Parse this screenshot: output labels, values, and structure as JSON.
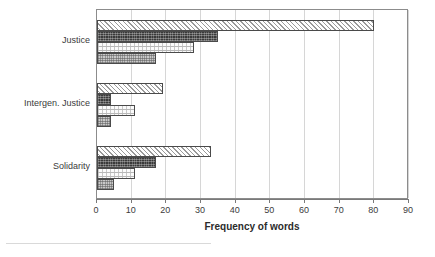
{
  "chart_data": {
    "type": "bar",
    "orientation": "horizontal",
    "title": "",
    "subtitle": "",
    "xlabel": "Frequency of words",
    "ylabel": "",
    "xlim": [
      0,
      90
    ],
    "xticks": [
      0,
      10,
      20,
      30,
      40,
      50,
      60,
      70,
      80,
      90
    ],
    "xtick_labels": [
      "0",
      "10",
      "20",
      "30",
      "40",
      "50",
      "60",
      "70",
      "80",
      "90"
    ],
    "categories": [
      "Justice",
      "Intergen. Justice",
      "Solidarity"
    ],
    "grid": "vertical",
    "legend": "none",
    "series": [
      {
        "name": "Series 1",
        "pattern": "diagonal-hatch",
        "values": [
          80,
          19,
          33
        ]
      },
      {
        "name": "Series 2",
        "pattern": "dark-crosshatch",
        "values": [
          35,
          4,
          17
        ]
      },
      {
        "name": "Series 3",
        "pattern": "light-dots",
        "values": [
          28,
          11,
          11
        ]
      },
      {
        "name": "Series 4",
        "pattern": "grey-checker",
        "values": [
          17,
          4,
          5
        ]
      }
    ],
    "colors": {
      "axis": "#7a7a7a",
      "grid": "#d6d6d6",
      "frame": "#8c8c8c",
      "bar_outline": "#4a4a4a",
      "text": "#2b2b2b",
      "background": "#ffffff"
    }
  }
}
